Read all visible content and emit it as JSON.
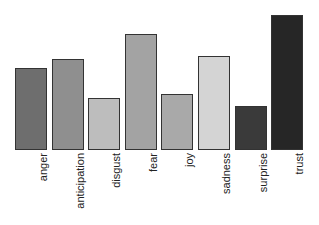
{
  "chart_data": {
    "type": "bar",
    "title": "",
    "xlabel": "",
    "ylabel": "",
    "categories": [
      "anger",
      "anticipation",
      "disgust",
      "fear",
      "joy",
      "sadness",
      "surprise",
      "trust"
    ],
    "values": [
      81,
      90,
      52,
      115,
      56,
      93,
      44,
      134
    ],
    "colors": [
      "#6e6e6e",
      "#8f8f8f",
      "#bdbdbd",
      "#a3a3a3",
      "#a9a9a9",
      "#d4d4d4",
      "#3a3a3a",
      "#262626"
    ],
    "ylim": [
      0,
      134
    ],
    "grid": false,
    "legend": "none",
    "note": "No y-axis shown; values are relative bar heights in pixels"
  },
  "labels": {
    "0": "anger",
    "1": "anticipation",
    "2": "disgust",
    "3": "fear",
    "4": "joy",
    "5": "sadness",
    "6": "surprise",
    "7": "trust"
  }
}
